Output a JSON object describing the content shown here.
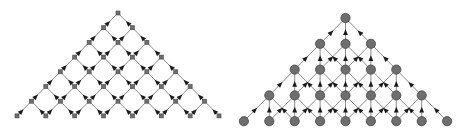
{
  "figure": {
    "panels": [
      {
        "id": "left",
        "kind": "binomial-lattice",
        "rows": 8,
        "children_per_node": 2,
        "origin": {
          "x": 118,
          "y": 13
        },
        "dx": 14.43,
        "dy": 14.7,
        "node_shape": "square",
        "node_size": 4,
        "arrow_position": 0.72,
        "arrow_direction": "toward-parent"
      },
      {
        "id": "right",
        "kind": "trinomial-lattice",
        "rows": 5,
        "children_per_node": 3,
        "origin": {
          "x": 113.5,
          "y": 18
        },
        "dx": 25.4,
        "dy": 25.8,
        "node_shape": "circle",
        "node_size": 4.6,
        "arrow_position": 0.58,
        "arrow_direction": "toward-parent"
      }
    ],
    "colors": {
      "edge": "#8a8a8a",
      "arrow": "#1a1a1a",
      "node_fill": "#6e6e6e",
      "node_stroke": "#444444",
      "background": "#ffffff"
    }
  }
}
